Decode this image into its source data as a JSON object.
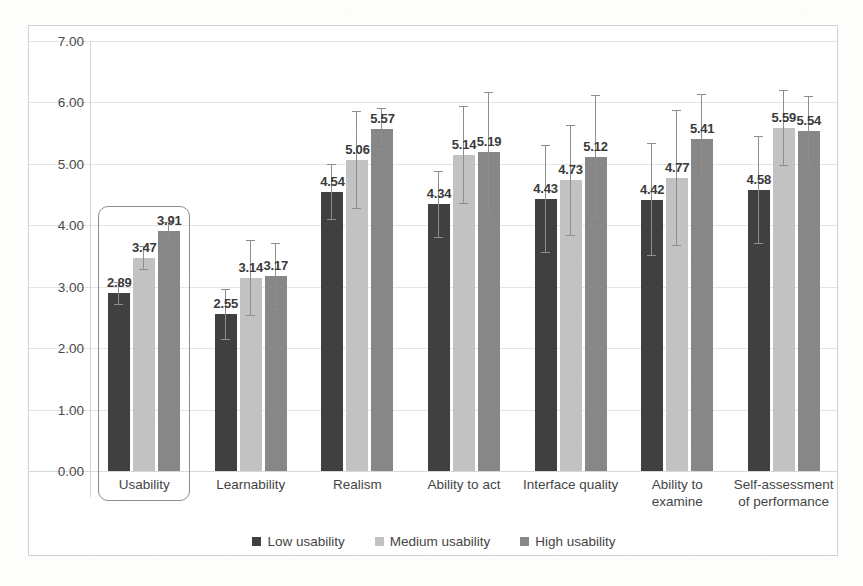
{
  "chart_data": {
    "type": "bar",
    "title": "",
    "subtitle": "",
    "xlabel": "",
    "ylabel": "",
    "ylim": [
      0,
      7
    ],
    "ytick_labels": [
      "0.00",
      "1.00",
      "2.00",
      "3.00",
      "4.00",
      "5.00",
      "6.00",
      "7.00"
    ],
    "ytick_values": [
      0,
      1,
      2,
      3,
      4,
      5,
      6,
      7
    ],
    "grid": true,
    "legend_position": "bottom",
    "error_bars": true,
    "categories": [
      "Usability",
      "Learnability",
      "Realism",
      "Ability to act",
      "Interface quality",
      "Ability to\nexamine",
      "Self-assessment\nof performance"
    ],
    "series": [
      {
        "name": "Low usability",
        "color": "#404040",
        "values": [
          2.89,
          2.55,
          4.54,
          4.34,
          4.43,
          4.42,
          4.58
        ],
        "errors": [
          0.18,
          0.42,
          0.46,
          0.55,
          0.88,
          0.92,
          0.88
        ]
      },
      {
        "name": "Medium usability",
        "color": "#c2c2c2",
        "values": [
          3.47,
          3.14,
          5.06,
          5.14,
          4.73,
          4.77,
          5.59
        ],
        "errors": [
          0.2,
          0.62,
          0.8,
          0.8,
          0.9,
          1.1,
          0.62
        ]
      },
      {
        "name": "High usability",
        "color": "#878787",
        "values": [
          3.91,
          3.17,
          5.57,
          5.19,
          5.12,
          5.41,
          5.54
        ],
        "errors": [
          0.14,
          0.55,
          0.34,
          0.98,
          1.0,
          0.72,
          0.56
        ]
      }
    ],
    "value_labels": [
      [
        "2.89",
        "3.47",
        "3.91"
      ],
      [
        "2.55",
        "3.14",
        "3.17"
      ],
      [
        "4.54",
        "5.06",
        "5.57"
      ],
      [
        "4.34",
        "5.14",
        "5.19"
      ],
      [
        "4.43",
        "4.73",
        "5.12"
      ],
      [
        "4.42",
        "4.77",
        "5.41"
      ],
      [
        "4.58",
        "5.59",
        "5.54"
      ]
    ],
    "highlight": {
      "category": "Usability",
      "shape": "rounded-rectangle",
      "color": "#8d8d8d"
    }
  },
  "legend": {
    "items": [
      {
        "label": "Low usability",
        "color": "#404040"
      },
      {
        "label": "Medium usability",
        "color": "#c2c2c2"
      },
      {
        "label": "High usability",
        "color": "#878787"
      }
    ]
  }
}
